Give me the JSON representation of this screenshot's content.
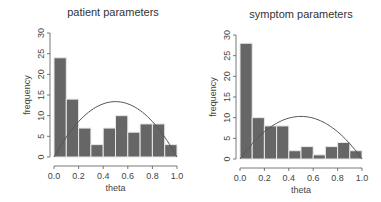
{
  "chart_data": [
    {
      "type": "bar",
      "title": "patient parameters",
      "xlabel": "theta",
      "ylabel": "frequency",
      "xlim": [
        0.0,
        1.0
      ],
      "ylim": [
        0,
        30
      ],
      "x_ticks": [
        "0.0",
        "0.2",
        "0.4",
        "0.6",
        "0.8",
        "1.0"
      ],
      "y_ticks": [
        "0",
        "5",
        "10",
        "15",
        "20",
        "25",
        "30"
      ],
      "bin_edges": [
        0.0,
        0.1,
        0.2,
        0.3,
        0.4,
        0.5,
        0.6,
        0.7,
        0.8,
        0.9,
        1.0
      ],
      "categories": [
        "0.0-0.1",
        "0.1-0.2",
        "0.2-0.3",
        "0.3-0.4",
        "0.4-0.5",
        "0.5-0.6",
        "0.6-0.7",
        "0.7-0.8",
        "0.8-0.9",
        "0.9-1.0"
      ],
      "values": [
        24,
        14,
        7,
        3,
        7,
        10,
        6,
        8,
        8,
        3
      ],
      "overlay_curve": {
        "type": "line",
        "shape": "parabola",
        "peak_x": 0.5,
        "peak_y": 13.4,
        "endpoints_y": 0
      },
      "bar_color": "#666666",
      "grid": false
    },
    {
      "type": "bar",
      "title": "symptom parameters",
      "xlabel": "theta",
      "ylabel": "frequency",
      "xlim": [
        0.0,
        1.0
      ],
      "ylim": [
        0,
        30
      ],
      "x_ticks": [
        "0.0",
        "0.2",
        "0.4",
        "0.6",
        "0.8",
        "1.0"
      ],
      "y_ticks": [
        "0",
        "5",
        "10",
        "15",
        "20",
        "25",
        "30"
      ],
      "bin_edges": [
        0.0,
        0.1,
        0.2,
        0.3,
        0.4,
        0.5,
        0.6,
        0.7,
        0.8,
        0.9,
        1.0
      ],
      "categories": [
        "0.0-0.1",
        "0.1-0.2",
        "0.2-0.3",
        "0.3-0.4",
        "0.4-0.5",
        "0.5-0.6",
        "0.6-0.7",
        "0.7-0.8",
        "0.8-0.9",
        "0.9-1.0"
      ],
      "values": [
        28,
        10,
        8,
        8,
        2,
        3,
        1,
        3,
        4,
        2
      ],
      "overlay_curve": {
        "type": "line",
        "shape": "parabola",
        "peak_x": 0.5,
        "peak_y": 10.3,
        "endpoints_y": 0
      },
      "bar_color": "#666666",
      "grid": false
    }
  ],
  "layout": {
    "panels": [
      {
        "plot_left": 54,
        "plot_right": 177,
        "y0_px": 157,
        "y30_px": 33,
        "axis_x": 50,
        "xaxis_y": 166,
        "title_x": 113,
        "title_y": 16
      },
      {
        "plot_left": 240,
        "plot_right": 362,
        "y0_px": 159,
        "y30_px": 35,
        "axis_x": 236,
        "xaxis_y": 168,
        "title_x": 301,
        "title_y": 18
      }
    ],
    "bar_fill": "#666666",
    "bar_stroke": "#e8e8e8",
    "curve_color": "#555555",
    "axis_color": "#555555"
  }
}
